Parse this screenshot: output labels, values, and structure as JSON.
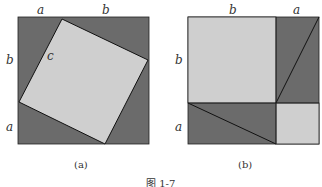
{
  "figure_a": {
    "caption": "(a)",
    "labels": {
      "top_a": "a",
      "top_b": "b",
      "left_b": "b",
      "left_a": "a",
      "hyp_c": "c"
    }
  },
  "figure_b": {
    "caption": "(b)",
    "labels": {
      "top_b": "b",
      "top_a": "a",
      "left_b": "b",
      "left_a": "a"
    }
  },
  "footer_caption": "图 1-7",
  "colors": {
    "dark": "#6b6b6b",
    "light": "#cfcfcf",
    "stroke": "#111111"
  }
}
